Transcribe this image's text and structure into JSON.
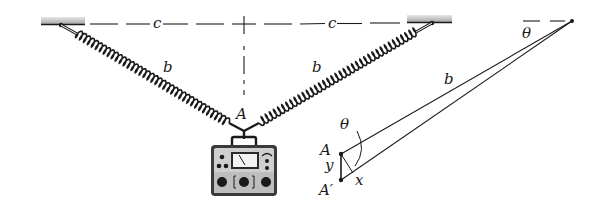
{
  "figure": {
    "labels": {
      "c_left": "c",
      "c_right": "c",
      "b_left": "b",
      "b_right": "b",
      "A_main": "A",
      "theta_top": "θ",
      "b_detail": "b",
      "theta_detail": "θ",
      "A_detail": "A",
      "y_detail": "y",
      "A_prime_detail": "A′",
      "x_detail": "x"
    },
    "colors": {
      "ink": "#1a1a1a",
      "ceiling": "#bdbdbd",
      "instrument_body": "#3a3a3a",
      "instrument_panel": "#d9d9d9"
    }
  }
}
